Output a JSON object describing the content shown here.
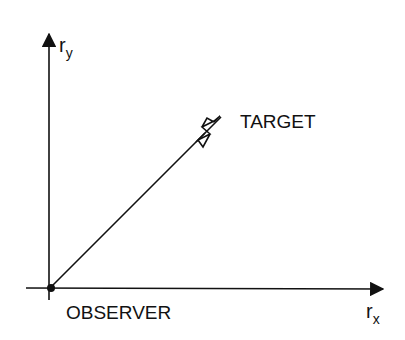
{
  "diagram": {
    "y_axis_label": {
      "base": "r",
      "sub": "y"
    },
    "x_axis_label": {
      "base": "r",
      "sub": "x"
    },
    "target_label": "TARGET",
    "observer_label": "OBSERVER",
    "colors": {
      "ink": "#111111",
      "background": "#ffffff"
    }
  }
}
